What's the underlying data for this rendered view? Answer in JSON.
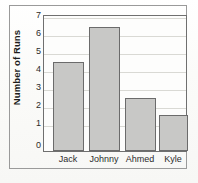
{
  "figure": {
    "background_color": "#fdfdfb",
    "frame_color": "#9a9a9a",
    "plot_border_color": "#6f6f6f"
  },
  "chart_data": {
    "type": "bar",
    "title": "",
    "xlabel": "",
    "ylabel": "Number of Runs",
    "categories": [
      "Jack",
      "Johnny",
      "Ahmed",
      "Kyle"
    ],
    "values": [
      5,
      7,
      3,
      2
    ],
    "ylim": [
      0,
      7.6
    ],
    "yticks": [
      0,
      1,
      2,
      3,
      4,
      5,
      6,
      7
    ],
    "ytick_labels": [
      "0",
      "1",
      "2",
      "3",
      "4",
      "5",
      "6",
      "7"
    ],
    "grid": true,
    "grid_axis": "y",
    "legend": false,
    "bar_color": "#c8c8c6",
    "bar_edge_color": "#6b6b6b"
  }
}
